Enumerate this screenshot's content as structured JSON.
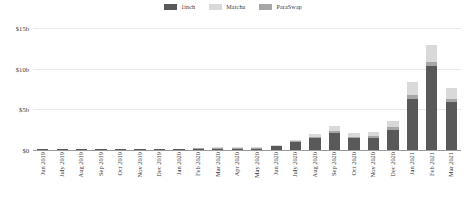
{
  "legend": {
    "position": "top-center",
    "items": [
      {
        "label": "1inch",
        "color": "#595959"
      },
      {
        "label": "Matcha",
        "color": "#d9d9d9"
      },
      {
        "label": "ParaSwap",
        "color": "#a6a6a6"
      }
    ]
  },
  "chart_data": {
    "type": "bar",
    "stacked": true,
    "title": "",
    "subtitle": "",
    "xlabel": "",
    "ylabel": "",
    "ylim": [
      0,
      15
    ],
    "yticks": [
      0,
      5,
      10,
      15
    ],
    "ytick_labels": [
      "$0",
      "$5b",
      "$10b",
      "$15b"
    ],
    "grid": true,
    "units": "billions USD",
    "categories": [
      "Jun 2019",
      "July 2019",
      "Aug 2019",
      "Sep 2019",
      "Oct 2019",
      "Nov 2019",
      "Dec 2019",
      "Jan 2020",
      "Feb 2020",
      "Mar 2020",
      "Apr 2020",
      "May 2020",
      "Jun 2020",
      "July 2020",
      "Aug 2020",
      "Sep 2020",
      "Oct 2020",
      "Nov 2020",
      "Dec 2020",
      "Jan 2021",
      "Feb 2021",
      "Mar 2021"
    ],
    "series": [
      {
        "name": "1inch",
        "color": "#595959",
        "values": [
          0.01,
          0.01,
          0.02,
          0.02,
          0.03,
          0.03,
          0.05,
          0.07,
          0.1,
          0.13,
          0.12,
          0.18,
          0.45,
          0.95,
          1.45,
          2.05,
          1.45,
          1.5,
          2.5,
          6.3,
          10.3,
          5.9
        ]
      },
      {
        "name": "Matcha",
        "color": "#d9d9d9",
        "values": [
          0,
          0,
          0,
          0,
          0,
          0,
          0,
          0,
          0,
          0.01,
          0.02,
          0.03,
          0.08,
          0.2,
          0.35,
          0.6,
          0.4,
          0.45,
          0.75,
          1.55,
          2.05,
          1.3
        ]
      },
      {
        "name": "ParaSwap",
        "color": "#a6a6a6",
        "values": [
          0,
          0,
          0,
          0,
          0,
          0,
          0,
          0,
          0.01,
          0.02,
          0.02,
          0.03,
          0.06,
          0.12,
          0.2,
          0.3,
          0.2,
          0.22,
          0.35,
          0.5,
          0.55,
          0.4
        ]
      }
    ],
    "totals": [
      0.01,
      0.01,
      0.02,
      0.02,
      0.03,
      0.03,
      0.05,
      0.07,
      0.11,
      0.16,
      0.16,
      0.24,
      0.59,
      1.27,
      2.0,
      2.95,
      2.05,
      2.17,
      3.6,
      8.35,
      12.9,
      7.6
    ],
    "max_total": 12.9,
    "peak_category": "Feb 2021"
  }
}
